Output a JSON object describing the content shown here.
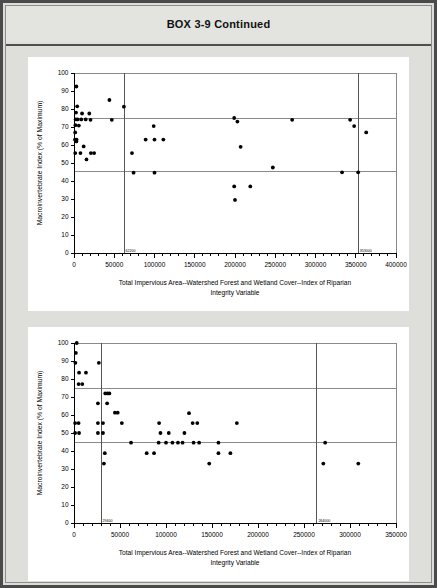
{
  "page": {
    "title": "BOX 3-9 Continued"
  },
  "charts": [
    {
      "id": "chart1",
      "chart_data": {
        "type": "scatter",
        "title": "",
        "xlabel": "Total Impervious Area--Watershed Forest and Wetland Cover--Index of Riparian Integrity Variable",
        "ylabel": "Macroinvertebrate Index (% of Maximum)",
        "xlim": [
          0,
          400000
        ],
        "ylim": [
          0,
          100
        ],
        "xticks": [
          0,
          50000,
          100000,
          150000,
          200000,
          250000,
          300000,
          350000,
          400000
        ],
        "xticklabels": [
          "0",
          "50000",
          "100000",
          "150000",
          "200000",
          "250000",
          "300000",
          "350000",
          "400000"
        ],
        "yticks": [
          0,
          10,
          20,
          30,
          40,
          50,
          60,
          70,
          80,
          90,
          100
        ],
        "yticklabels": [
          "0",
          "10",
          "20",
          "30",
          "40",
          "50",
          "60",
          "70",
          "80",
          "90",
          "100"
        ],
        "grid": false,
        "legend": null,
        "reference_lines": {
          "vertical": [
            {
              "value": 62200,
              "label": "62200"
            },
            {
              "value": 353000,
              "label": "353000"
            }
          ],
          "horizontal": [
            {
              "value": 74.5,
              "label": ""
            },
            {
              "value": 45.5,
              "label": ""
            }
          ]
        },
        "points": [
          {
            "x": 3000,
            "y": 92.5
          },
          {
            "x": 4000,
            "y": 81.5
          },
          {
            "x": 2500,
            "y": 78.0
          },
          {
            "x": 10000,
            "y": 77.5
          },
          {
            "x": 19000,
            "y": 77.5
          },
          {
            "x": 2000,
            "y": 74.2
          },
          {
            "x": 4500,
            "y": 74.2
          },
          {
            "x": 9000,
            "y": 74.2
          },
          {
            "x": 14500,
            "y": 74.2
          },
          {
            "x": 20500,
            "y": 74.0
          },
          {
            "x": 1800,
            "y": 71.0
          },
          {
            "x": 6000,
            "y": 70.8
          },
          {
            "x": 1500,
            "y": 67.0
          },
          {
            "x": 1200,
            "y": 63.0
          },
          {
            "x": 3200,
            "y": 63.0
          },
          {
            "x": 3000,
            "y": 62.0
          },
          {
            "x": 12000,
            "y": 59.2
          },
          {
            "x": 1500,
            "y": 55.5
          },
          {
            "x": 8000,
            "y": 55.5
          },
          {
            "x": 21000,
            "y": 55.5
          },
          {
            "x": 25000,
            "y": 55.5
          },
          {
            "x": 15500,
            "y": 52.0
          },
          {
            "x": 44000,
            "y": 85.0
          },
          {
            "x": 62000,
            "y": 81.3
          },
          {
            "x": 47000,
            "y": 74.0
          },
          {
            "x": 72000,
            "y": 55.5
          },
          {
            "x": 74000,
            "y": 44.6
          },
          {
            "x": 100000,
            "y": 44.6
          },
          {
            "x": 99000,
            "y": 70.5
          },
          {
            "x": 89000,
            "y": 63.0
          },
          {
            "x": 100000,
            "y": 63.0
          },
          {
            "x": 111000,
            "y": 63.0
          },
          {
            "x": 199000,
            "y": 75.0
          },
          {
            "x": 203000,
            "y": 73.0
          },
          {
            "x": 207000,
            "y": 59.0
          },
          {
            "x": 199000,
            "y": 37.0
          },
          {
            "x": 200000,
            "y": 29.5
          },
          {
            "x": 219000,
            "y": 37.0
          },
          {
            "x": 247000,
            "y": 47.5
          },
          {
            "x": 271000,
            "y": 74.0
          },
          {
            "x": 333000,
            "y": 44.8
          },
          {
            "x": 353000,
            "y": 44.8
          },
          {
            "x": 343000,
            "y": 74.0
          },
          {
            "x": 348000,
            "y": 70.5
          },
          {
            "x": 363000,
            "y": 67.0
          }
        ]
      }
    },
    {
      "id": "chart2",
      "chart_data": {
        "type": "scatter",
        "title": "",
        "xlabel": "Total Impervious Area--Watershed Forest and Wetland Cover--Index of Riparian Integrity Variable",
        "ylabel": "Macroinvertebrate Index (% of Maximum)",
        "xlim": [
          0,
          350000
        ],
        "ylim": [
          0,
          100
        ],
        "xticks": [
          0,
          50000,
          100000,
          150000,
          200000,
          250000,
          300000,
          350000
        ],
        "xticklabels": [
          "0",
          "50000",
          "100000",
          "150000",
          "200000",
          "250000",
          "300000",
          "350000"
        ],
        "yticks": [
          0,
          10,
          20,
          30,
          40,
          50,
          60,
          70,
          80,
          90,
          100
        ],
        "yticklabels": [
          "0",
          "10",
          "20",
          "30",
          "40",
          "50",
          "60",
          "70",
          "80",
          "90",
          "100"
        ],
        "grid": false,
        "legend": null,
        "reference_lines": {
          "vertical": [
            {
              "value": 29400,
              "label": "29400"
            },
            {
              "value": 264000,
              "label": "264000"
            }
          ],
          "horizontal": [
            {
              "value": 74.5,
              "label": ""
            },
            {
              "value": 45.0,
              "label": ""
            }
          ]
        },
        "points": [
          {
            "x": 3000,
            "y": 100.0
          },
          {
            "x": 2000,
            "y": 94.5
          },
          {
            "x": 1500,
            "y": 89.0
          },
          {
            "x": 5500,
            "y": 83.5
          },
          {
            "x": 13000,
            "y": 83.5
          },
          {
            "x": 5000,
            "y": 77.2
          },
          {
            "x": 9000,
            "y": 77.2
          },
          {
            "x": 27000,
            "y": 89.0
          },
          {
            "x": 1200,
            "y": 55.5
          },
          {
            "x": 5000,
            "y": 55.5
          },
          {
            "x": 1200,
            "y": 50.0
          },
          {
            "x": 5500,
            "y": 50.0
          },
          {
            "x": 34000,
            "y": 72.0
          },
          {
            "x": 36500,
            "y": 72.0
          },
          {
            "x": 38500,
            "y": 72.0
          },
          {
            "x": 26000,
            "y": 66.5
          },
          {
            "x": 36000,
            "y": 66.5
          },
          {
            "x": 44500,
            "y": 61.3
          },
          {
            "x": 47500,
            "y": 61.3
          },
          {
            "x": 26000,
            "y": 55.5
          },
          {
            "x": 31500,
            "y": 55.5
          },
          {
            "x": 52000,
            "y": 55.5
          },
          {
            "x": 26000,
            "y": 50.0
          },
          {
            "x": 31500,
            "y": 50.0
          },
          {
            "x": 33500,
            "y": 38.8
          },
          {
            "x": 32500,
            "y": 33.0
          },
          {
            "x": 62000,
            "y": 44.6
          },
          {
            "x": 79000,
            "y": 38.8
          },
          {
            "x": 87000,
            "y": 38.8
          },
          {
            "x": 92500,
            "y": 55.5
          },
          {
            "x": 94000,
            "y": 50.0
          },
          {
            "x": 103000,
            "y": 50.0
          },
          {
            "x": 92000,
            "y": 44.6
          },
          {
            "x": 100000,
            "y": 44.6
          },
          {
            "x": 107000,
            "y": 44.6
          },
          {
            "x": 113000,
            "y": 44.6
          },
          {
            "x": 118000,
            "y": 44.6
          },
          {
            "x": 125000,
            "y": 61.0
          },
          {
            "x": 129000,
            "y": 55.5
          },
          {
            "x": 134000,
            "y": 55.5
          },
          {
            "x": 120000,
            "y": 50.0
          },
          {
            "x": 130000,
            "y": 44.6
          },
          {
            "x": 136000,
            "y": 44.6
          },
          {
            "x": 147000,
            "y": 33.0
          },
          {
            "x": 157000,
            "y": 44.6
          },
          {
            "x": 157000,
            "y": 38.8
          },
          {
            "x": 170000,
            "y": 38.8
          },
          {
            "x": 177000,
            "y": 55.5
          },
          {
            "x": 271000,
            "y": 33.0
          },
          {
            "x": 309000,
            "y": 33.0
          },
          {
            "x": 273000,
            "y": 44.6
          }
        ]
      }
    }
  ]
}
